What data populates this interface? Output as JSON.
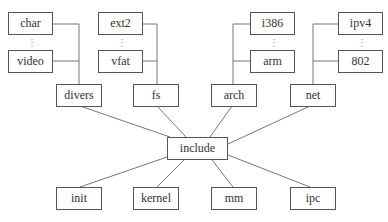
{
  "diagram": {
    "type": "tree",
    "root": "include",
    "nodes": {
      "char": "char",
      "video": "video",
      "ext2": "ext2",
      "vfat": "vfat",
      "i386": "i386",
      "arm": "arm",
      "ipv4": "ipv4",
      "n802": "802",
      "divers": "divers",
      "fs": "fs",
      "arch": "arch",
      "net": "net",
      "include": "include",
      "init": "init",
      "kernel": "kernel",
      "mm": "mm",
      "ipc": "ipc"
    },
    "ellipsis": "⋮",
    "edges": [
      [
        "char",
        "divers"
      ],
      [
        "video",
        "divers"
      ],
      [
        "ext2",
        "fs"
      ],
      [
        "vfat",
        "fs"
      ],
      [
        "i386",
        "arch"
      ],
      [
        "arm",
        "arch"
      ],
      [
        "ipv4",
        "net"
      ],
      [
        "802",
        "net"
      ],
      [
        "divers",
        "include"
      ],
      [
        "fs",
        "include"
      ],
      [
        "arch",
        "include"
      ],
      [
        "net",
        "include"
      ],
      [
        "include",
        "init"
      ],
      [
        "include",
        "kernel"
      ],
      [
        "include",
        "mm"
      ],
      [
        "include",
        "ipc"
      ]
    ]
  }
}
